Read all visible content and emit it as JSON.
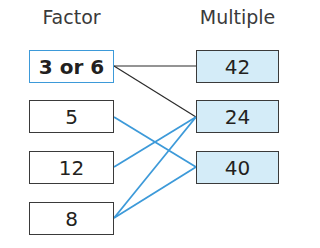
{
  "headers": {
    "factor": "Factor",
    "multiple": "Multiple"
  },
  "factors": [
    {
      "label": "3 or 6",
      "highlighted": true
    },
    {
      "label": "5"
    },
    {
      "label": "12"
    },
    {
      "label": "8"
    }
  ],
  "multiples": [
    {
      "label": "42"
    },
    {
      "label": "24"
    },
    {
      "label": "40"
    }
  ],
  "connections": [
    {
      "from": "3 or 6",
      "to": "42",
      "color": "#2b2b2b"
    },
    {
      "from": "3 or 6",
      "to": "24",
      "color": "#2b2b2b"
    },
    {
      "from": "5",
      "to": "40",
      "color": "#3d9ad9"
    },
    {
      "from": "12",
      "to": "24",
      "color": "#3d9ad9"
    },
    {
      "from": "8",
      "to": "24",
      "color": "#3d9ad9"
    },
    {
      "from": "8",
      "to": "40",
      "color": "#3d9ad9"
    }
  ],
  "colors": {
    "highlight": "#3d9ad9",
    "multiple_fill": "#d4ecf8",
    "border": "#3a3a3a"
  }
}
